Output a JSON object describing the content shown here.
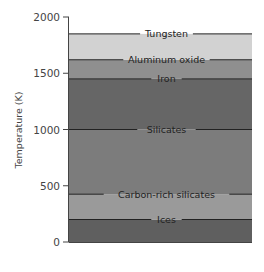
{
  "chart_data": {
    "type": "bar",
    "title": "",
    "xlabel": "",
    "ylabel": "Temperature (K)",
    "ylim": [
      0,
      2000
    ],
    "yticks": [
      0,
      500,
      1000,
      1500,
      2000
    ],
    "grid": false,
    "legend": "none",
    "layers": [
      {
        "name": "Ices",
        "from": 0,
        "to": 200,
        "color": "#5f5f5f"
      },
      {
        "name": "Carbon-rich silicates",
        "from": 200,
        "to": 425,
        "color": "#9a9a9a"
      },
      {
        "name": "Silicates",
        "from": 425,
        "to": 1000,
        "color": "#7c7c7c"
      },
      {
        "name": "Iron",
        "from": 1000,
        "to": 1450,
        "color": "#666666"
      },
      {
        "name": "Aluminum oxide",
        "from": 1450,
        "to": 1620,
        "color": "#8f8f8f"
      },
      {
        "name": "Tungsten",
        "from": 1620,
        "to": 1850,
        "color": "#d2d2d2"
      }
    ],
    "condensation_lines": [
      {
        "label": "Tungsten",
        "value": 1850
      },
      {
        "label": "Aluminum oxide",
        "value": 1620
      },
      {
        "label": "Iron",
        "value": 1450
      },
      {
        "label": "Silicates",
        "value": 1000
      },
      {
        "label": "Carbon-rich silicates",
        "value": 425
      },
      {
        "label": "Ices",
        "value": 200
      }
    ]
  }
}
